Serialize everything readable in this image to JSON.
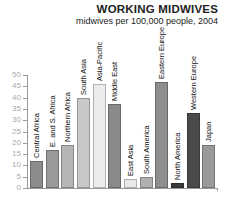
{
  "chart_data": {
    "type": "bar",
    "title": "WORKING MIDWIVES",
    "subtitle": "midwives per 100,000 people, 2004",
    "xlabel": "",
    "ylabel": "",
    "ylim": [
      0,
      50
    ],
    "yticks": [
      0,
      5,
      10,
      15,
      20,
      25,
      30,
      35,
      40,
      45,
      50
    ],
    "grid": false,
    "categories": [
      "Central Africa",
      "E. and S. Africa",
      "Northern Africa",
      "South Asia",
      "Asia-Pacific",
      "Middle East",
      "East Asia",
      "South America",
      "Eastern Europe",
      "North America",
      "Western Europe",
      "Japan"
    ],
    "values": [
      12,
      17,
      19,
      40,
      46,
      37,
      4,
      5,
      47,
      2,
      33,
      19
    ],
    "colors": [
      "#8c8c8c",
      "#999999",
      "#b5b5b5",
      "#c8c8c8",
      "#ececec",
      "#8a8a8a",
      "#e8e8e8",
      "#b0b0b0",
      "#8e8e8e",
      "#3a3a3a",
      "#4a4a4a",
      "#9a9a9a"
    ]
  }
}
